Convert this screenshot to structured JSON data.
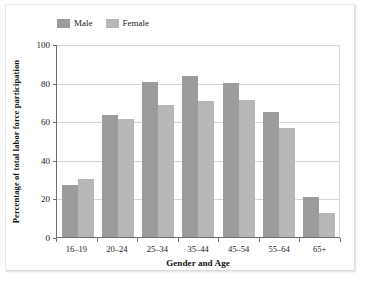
{
  "chart_data": {
    "type": "bar",
    "title": "",
    "subtitle": "",
    "xlabel": "Gender and Age",
    "ylabel": "Percentage of total labor force participation",
    "categories": [
      "16–19",
      "20–24",
      "25–34",
      "35–44",
      "45–54",
      "55–64",
      "65+"
    ],
    "series": [
      {
        "name": "Male",
        "color": "#9c9c9c",
        "values": [
          27,
          63,
          80.5,
          83.5,
          80,
          65,
          20.5
        ]
      },
      {
        "name": "Female",
        "color": "#b7b7b7",
        "values": [
          30,
          61,
          68.5,
          70.5,
          71,
          56.5,
          12.5
        ]
      }
    ],
    "ylim": [
      0,
      100
    ],
    "yticks": [
      0,
      20,
      40,
      60,
      80,
      100
    ],
    "ytick_labels": [
      "0",
      "20",
      "40",
      "60",
      "80",
      "100"
    ],
    "grid": "horizontal",
    "legend_position": "top-left",
    "legend": [
      "Male",
      "Female"
    ]
  },
  "colors": {
    "male": "#9c9c9c",
    "female": "#b7b7b7",
    "axis": "#6e6e6e",
    "gridline": "#d5d5d5",
    "text": "#1a1a1a",
    "background": "#ffffff"
  }
}
